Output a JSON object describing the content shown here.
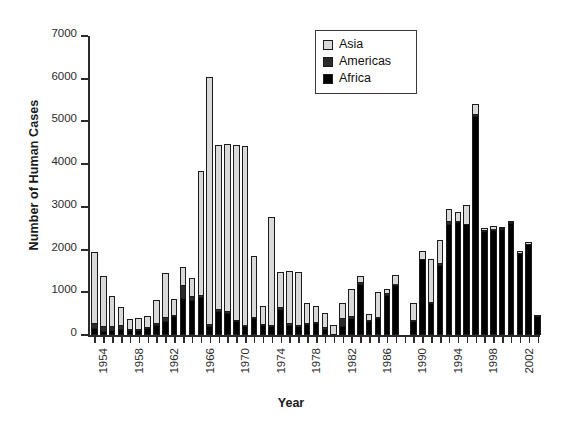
{
  "chart_data": {
    "type": "bar",
    "stacked": true,
    "title": "",
    "xlabel": "Year",
    "ylabel": "Number of Human Cases",
    "ylim": [
      0,
      7000
    ],
    "yticks": [
      0,
      1000,
      2000,
      3000,
      4000,
      5000,
      6000,
      7000
    ],
    "ytick_labels": [
      "0",
      "1000",
      "2000",
      "3000",
      "4000",
      "5000",
      "6000",
      "7000"
    ],
    "grid": false,
    "legend_position": "top-right",
    "legend": [
      "Asia",
      "Americas",
      "Africa"
    ],
    "categories": [
      "1954",
      "1955",
      "1956",
      "1957",
      "1958",
      "1959",
      "1960",
      "1961",
      "1962",
      "1963",
      "1964",
      "1965",
      "1966",
      "1967",
      "1968",
      "1969",
      "1970",
      "1971",
      "1972",
      "1973",
      "1974",
      "1975",
      "1976",
      "1977",
      "1978",
      "1979",
      "1980",
      "1981",
      "1982",
      "1983",
      "1984",
      "1985",
      "1986",
      "1987",
      "1988",
      "1989",
      "1990",
      "1991",
      "1992",
      "1993",
      "1994",
      "1995",
      "1996",
      "1997",
      "1998",
      "1999",
      "2000",
      "2001",
      "2002",
      "2003",
      "2004"
    ],
    "xtick_labels": [
      "1954",
      "1958",
      "1962",
      "1966",
      "1970",
      "1974",
      "1978",
      "1982",
      "1986",
      "1990",
      "1994",
      "1998",
      "2002"
    ],
    "xtick_every": 4,
    "series": [
      {
        "name": "Africa",
        "color": "#000000",
        "values": [
          160,
          90,
          110,
          130,
          110,
          120,
          170,
          240,
          330,
          450,
          870,
          820,
          900,
          220,
          560,
          520,
          330,
          220,
          400,
          240,
          200,
          620,
          240,
          200,
          260,
          270,
          150,
          0,
          200,
          400,
          1190,
          330,
          400,
          930,
          1180,
          0,
          320,
          1770,
          740,
          1640,
          2600,
          2640,
          2590,
          5130,
          2440,
          2470,
          2480,
          2620,
          1910,
          2130,
          440
        ]
      },
      {
        "name": "Americas",
        "color": "#2b2b2b",
        "values": [
          110,
          110,
          90,
          100,
          40,
          20,
          20,
          40,
          100,
          30,
          300,
          90,
          30,
          30,
          40,
          40,
          30,
          10,
          20,
          20,
          40,
          40,
          30,
          30,
          20,
          30,
          30,
          0,
          200,
          50,
          40,
          10,
          30,
          50,
          20,
          0,
          20,
          10,
          30,
          40,
          60,
          30,
          20,
          50,
          30,
          20,
          20,
          20,
          20,
          10,
          10
        ]
      },
      {
        "name": "Asia",
        "color": "#d9d9d9",
        "values": [
          1670,
          1190,
          710,
          420,
          230,
          250,
          260,
          540,
          1020,
          370,
          430,
          420,
          2910,
          5780,
          3860,
          3920,
          4080,
          4200,
          1440,
          420,
          2530,
          820,
          1230,
          1250,
          480,
          370,
          340,
          240,
          360,
          630,
          150,
          160,
          580,
          100,
          200,
          0,
          420,
          190,
          1010,
          550,
          290,
          220,
          440,
          230,
          30,
          70,
          30,
          40,
          20,
          10,
          10
        ]
      }
    ],
    "totals": [
      1940,
      1390,
      910,
      650,
      380,
      390,
      450,
      820,
      1450,
      850,
      1600,
      1330,
      3840,
      6030,
      4460,
      4480,
      4440,
      4430,
      1860,
      680,
      2770,
      1480,
      1500,
      1480,
      760,
      670,
      520,
      240,
      760,
      1080,
      1380,
      500,
      1010,
      1080,
      1400,
      0,
      760,
      1970,
      1780,
      2230,
      2950,
      2890,
      3050,
      5410,
      2500,
      2560,
      2530,
      2680,
      1950,
      2150,
      460
    ]
  }
}
